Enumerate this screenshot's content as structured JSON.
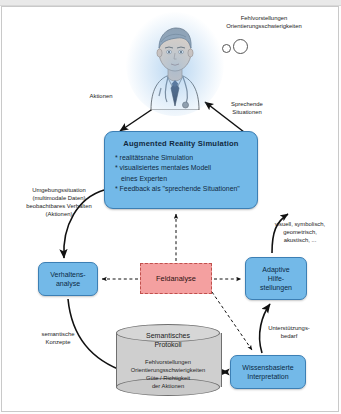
{
  "diagram": {
    "title_node": {
      "heading": "Augmented Reality Simulation",
      "bullets": [
        "* realitätsnahe Simulation",
        "* visualisiertes mentales Modell",
        "eines Experten",
        "* Feedback als \"sprechende Situationen\""
      ]
    },
    "nodes": {
      "behavior_analysis": "Verhaltens-\nanalyse",
      "behavior_analysis_line1": "Verhaltens-",
      "behavior_analysis_line2": "analyse",
      "field_analysis": "Feldanalyse",
      "adaptive_help_line1": "Adaptive",
      "adaptive_help_line2": "Hilfe-",
      "adaptive_help_line3": "stellungen",
      "knowledge_based_line1": "Wissensbasierte",
      "knowledge_based_line2": "Interpretation",
      "protocol_title_line1": "Semantisches",
      "protocol_title_line2": "Protokoll",
      "protocol_content_line1": "Fehlvorstellungen",
      "protocol_content_line2": "Orientierungsschwierigkeiten",
      "protocol_content_line3": "Güte / Richtigkeit",
      "protocol_content_line4": "der Aktionen"
    },
    "labels": {
      "misconceptions_line1": "Fehlvorstellungen",
      "misconceptions_line2": "Orientierungsschwierigkeiten",
      "actions": "Aktionen",
      "speaking_situations_line1": "Sprechende",
      "speaking_situations_line2": "Situationen",
      "environment_line1": "Umgebungssituation",
      "environment_line2": "(multimodale Daten)",
      "environment_line3": "beobachtbares Verhalten",
      "environment_line4": "(Aktionen)",
      "modalities_line1": "visuell, symbolisch,",
      "modalities_line2": "geometrisch,",
      "modalities_line3": "akustisch, ...",
      "semantic_concepts_line1": "semantische",
      "semantic_concepts_line2": "Konzepte",
      "support_need_line1": "Unterstützungs-",
      "support_need_line2": "bedarf"
    },
    "colors": {
      "node_blue": "#73b9e8",
      "node_blue_border": "#3c7fb4",
      "field_analysis_red": "#f4a0a0",
      "field_analysis_border": "#c0504d",
      "cylinder_gray": "#cfcfcf",
      "arrow_black": "#111111"
    },
    "icons": {
      "person": "doctor-avatar-icon",
      "database": "cylinder-database-icon",
      "thought_bubbles": "thought-bubble-icon"
    }
  }
}
